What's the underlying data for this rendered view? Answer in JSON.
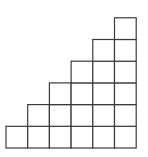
{
  "diagram": {
    "type": "staircase-grid",
    "columns": 6,
    "column_heights": [
      1,
      2,
      3,
      4,
      5,
      6
    ],
    "total_squares": 21,
    "cell_size": 21.7,
    "origin_x": 6,
    "base_y": 148,
    "stroke_color": "#3a3a3a",
    "fill_color": "#ffffff",
    "stroke_width": 1.2
  }
}
